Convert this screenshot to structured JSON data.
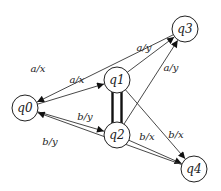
{
  "diagram": {
    "type": "state-machine",
    "colors": {
      "stroke": "#222222",
      "background": "#ffffff"
    },
    "nodes": [
      {
        "id": "q0",
        "label": "q0",
        "cx": 25,
        "cy": 108,
        "r": 13
      },
      {
        "id": "q1",
        "label": "q1",
        "cx": 117,
        "cy": 80,
        "r": 13
      },
      {
        "id": "q2",
        "label": "q2",
        "cx": 117,
        "cy": 135,
        "r": 13
      },
      {
        "id": "q3",
        "label": "q3",
        "cx": 185,
        "cy": 29,
        "r": 13
      },
      {
        "id": "q4",
        "label": "q4",
        "cx": 194,
        "cy": 169,
        "r": 13
      }
    ],
    "edges": [
      {
        "from": "q3",
        "to": "q0",
        "label": "a/x",
        "lx": 38,
        "ly": 72
      },
      {
        "from": "q0",
        "to": "q1",
        "label": "a/x",
        "lx": 77,
        "ly": 83
      },
      {
        "from": "q1",
        "to": "q3",
        "label": "a/y",
        "lx": 144,
        "ly": 51
      },
      {
        "from": "q2",
        "to": "q3",
        "label": "a/y",
        "lx": 171,
        "ly": 71
      },
      {
        "from": "q0",
        "to": "q2",
        "label": "b/y",
        "lx": 85,
        "ly": 120
      },
      {
        "from": "q2",
        "to": "q4",
        "label": "b/x",
        "lx": 147,
        "ly": 140
      },
      {
        "from": "q1",
        "to": "q4",
        "label": "b/x",
        "lx": 176,
        "ly": 138
      },
      {
        "from": "q4",
        "to": "q0",
        "label": "b/y",
        "lx": 50,
        "ly": 145
      }
    ],
    "undirected_links": [
      {
        "between": [
          "q1",
          "q2"
        ],
        "style": "double-bar"
      }
    ]
  }
}
